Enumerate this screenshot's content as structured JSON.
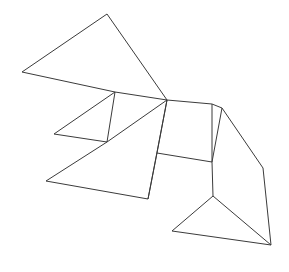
{
  "figure": {
    "type": "line-drawing",
    "background_color": "#ffffff",
    "stroke_color": "#3b3b3b",
    "stroke_width": 1,
    "fill": "none",
    "canvas": {
      "width": 289,
      "height": 272
    },
    "pieces": [
      {
        "name": "large-triangle-top-left",
        "points": "22,72 107,14 167,100"
      },
      {
        "name": "thin-triangle-upper-left",
        "points": "22,72 167,100 115,92"
      },
      {
        "name": "small-triangle-left-notch",
        "points": "115,92 107,142 54,134"
      },
      {
        "name": "medium-triangle-left-lower",
        "points": "107,142 167,100 46,181"
      },
      {
        "name": "large-triangle-bottom-left",
        "points": "46,181 148,199 167,100"
      },
      {
        "name": "parallelogram-center",
        "points": "167,100 212,104 212,162 157,153"
      },
      {
        "name": "quad-center-lower",
        "points": "167,100 157,153 148,199 167,100"
      },
      {
        "name": "triangle-right-upper",
        "points": "212,104 222,108 263,168"
      },
      {
        "name": "quad-right",
        "points": "222,108 263,168 271,245 212,162"
      },
      {
        "name": "triangle-bottom-right",
        "points": "172,231 213,196 271,245"
      },
      {
        "name": "triangle-bottom-right-inner",
        "points": "213,196 212,162 271,245"
      }
    ],
    "edges": [
      {
        "name": "edge-topleft-apex-left",
        "x1": 22,
        "y1": 72,
        "x2": 107,
        "y2": 14
      },
      {
        "name": "edge-apex-hub",
        "x1": 107,
        "y1": 14,
        "x2": 167,
        "y2": 100
      },
      {
        "name": "edge-left-to-notch",
        "x1": 22,
        "y1": 72,
        "x2": 115,
        "y2": 92
      },
      {
        "name": "edge-notch-to-hub",
        "x1": 115,
        "y1": 92,
        "x2": 167,
        "y2": 100
      },
      {
        "name": "edge-notch-down",
        "x1": 115,
        "y1": 92,
        "x2": 107,
        "y2": 142
      },
      {
        "name": "edge-notch-to-smallleft",
        "x1": 115,
        "y1": 92,
        "x2": 54,
        "y2": 134
      },
      {
        "name": "edge-smallleft-to-lowernotch",
        "x1": 54,
        "y1": 134,
        "x2": 107,
        "y2": 142
      },
      {
        "name": "edge-lowernotch-to-hub",
        "x1": 107,
        "y1": 142,
        "x2": 167,
        "y2": 100
      },
      {
        "name": "edge-lowernotch-to-bottomleft",
        "x1": 107,
        "y1": 142,
        "x2": 46,
        "y2": 181
      },
      {
        "name": "edge-bottomleft-to-bottommid",
        "x1": 46,
        "y1": 181,
        "x2": 148,
        "y2": 199
      },
      {
        "name": "edge-bottommid-to-hub",
        "x1": 148,
        "y1": 199,
        "x2": 167,
        "y2": 100
      },
      {
        "name": "edge-hub-to-rightsquare-top",
        "x1": 167,
        "y1": 100,
        "x2": 212,
        "y2": 104
      },
      {
        "name": "edge-hub-to-square-bottomleft",
        "x1": 167,
        "y1": 100,
        "x2": 157,
        "y2": 153
      },
      {
        "name": "edge-square-bottom",
        "x1": 157,
        "y1": 153,
        "x2": 212,
        "y2": 162
      },
      {
        "name": "edge-square-right",
        "x1": 212,
        "y1": 104,
        "x2": 212,
        "y2": 162
      },
      {
        "name": "edge-square-bottomleft-down",
        "x1": 157,
        "y1": 153,
        "x2": 148,
        "y2": 199
      },
      {
        "name": "edge-rightsquare-to-rightcorner",
        "x1": 212,
        "y1": 104,
        "x2": 222,
        "y2": 108
      },
      {
        "name": "edge-rightcorner-to-farright",
        "x1": 222,
        "y1": 108,
        "x2": 263,
        "y2": 168
      },
      {
        "name": "edge-farright-to-bottomright",
        "x1": 263,
        "y1": 168,
        "x2": 271,
        "y2": 245
      },
      {
        "name": "edge-rightcorner-to-squareright",
        "x1": 222,
        "y1": 108,
        "x2": 212,
        "y2": 162
      },
      {
        "name": "edge-squareright-to-notchright",
        "x1": 212,
        "y1": 162,
        "x2": 213,
        "y2": 196
      },
      {
        "name": "edge-notchright-to-bottomright",
        "x1": 213,
        "y1": 196,
        "x2": 271,
        "y2": 245
      },
      {
        "name": "edge-notchright-to-bottomleftlow",
        "x1": 213,
        "y1": 196,
        "x2": 172,
        "y2": 231
      },
      {
        "name": "edge-bottomleftlow-to-bottomright",
        "x1": 172,
        "y1": 231,
        "x2": 271,
        "y2": 245
      }
    ]
  }
}
